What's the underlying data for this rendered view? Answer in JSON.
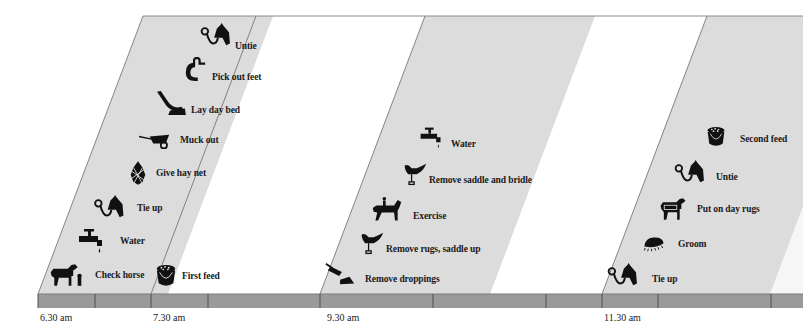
{
  "diagram": {
    "type": "daily-stable-routine-timeline",
    "colors": {
      "band": "#dcdcdc",
      "band_light": "#e8e8e8",
      "bar": "#9a9a9a",
      "bar_tick": "#555555",
      "outline": "#6a6a6a",
      "icon": "#111111"
    },
    "time_labels": [
      {
        "label": "6.30 am",
        "x": 40
      },
      {
        "label": "7.30 am",
        "x": 153
      },
      {
        "label": "9.30 am",
        "x": 327
      },
      {
        "label": "11.30 am",
        "x": 604
      }
    ],
    "groups": [
      {
        "time": "6.30 am",
        "tasks": [
          {
            "label": "Check horse",
            "icon": "horse-with-person-icon"
          },
          {
            "label": "Water",
            "icon": "tap-icon"
          },
          {
            "label": "Tie up",
            "icon": "horse-head-rope-icon"
          },
          {
            "label": "Give hay net",
            "icon": "hay-net-icon"
          },
          {
            "label": "Muck out",
            "icon": "wheelbarrow-icon"
          },
          {
            "label": "Lay day bed",
            "icon": "pitchfork-straw-icon"
          },
          {
            "label": "Pick out feet",
            "icon": "hoof-pick-icon"
          },
          {
            "label": "Untie",
            "icon": "horse-head-rope-icon"
          }
        ]
      },
      {
        "time": "7.30 am",
        "tasks": [
          {
            "label": "First feed",
            "icon": "feed-bucket-icon"
          }
        ]
      },
      {
        "time": "9.30 am",
        "tasks": [
          {
            "label": "Remove droppings",
            "icon": "shovel-icon"
          },
          {
            "label": "Remove rugs, saddle up",
            "icon": "saddle-icon"
          },
          {
            "label": "Exercise",
            "icon": "horse-rider-icon"
          },
          {
            "label": "Remove saddle and bridle",
            "icon": "saddle-icon"
          },
          {
            "label": "Water",
            "icon": "tap-icon"
          }
        ]
      },
      {
        "time": "11.30 am",
        "tasks": [
          {
            "label": "Tie up",
            "icon": "horse-head-rope-icon"
          },
          {
            "label": "Groom",
            "icon": "brush-icon"
          },
          {
            "label": "Put on day rugs",
            "icon": "rugged-horse-icon"
          },
          {
            "label": "Untie",
            "icon": "horse-head-rope-icon"
          },
          {
            "label": "Second feed",
            "icon": "feed-bucket-icon"
          }
        ]
      }
    ]
  }
}
